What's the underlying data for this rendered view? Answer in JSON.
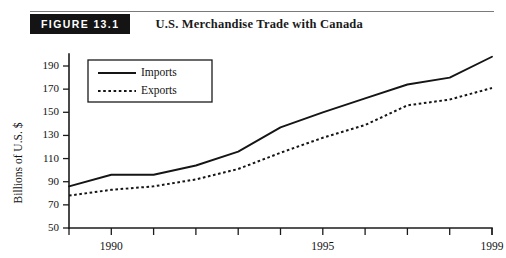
{
  "figure": {
    "badge_label": "FIGURE 13.1",
    "title": "U.S. Merchandise Trade with Canada"
  },
  "chart_data": {
    "type": "line",
    "title": "U.S. Merchandise Trade with Canada",
    "xlabel": "",
    "ylabel": "Billions of U.S. $",
    "x": [
      1989,
      1990,
      1991,
      1992,
      1993,
      1994,
      1995,
      1996,
      1997,
      1998,
      1999
    ],
    "xlim": [
      1989,
      1999
    ],
    "ylim": [
      50,
      190
    ],
    "yticks": [
      50,
      70,
      90,
      110,
      130,
      150,
      170,
      190
    ],
    "xticks": [
      1989,
      1990,
      1991,
      1992,
      1993,
      1994,
      1995,
      1996,
      1997,
      1998,
      1999
    ],
    "xtick_labels": [
      "",
      "1990",
      "",
      "",
      "",
      "",
      "1995",
      "",
      "",
      "",
      "1999"
    ],
    "grid": false,
    "legend_position": "upper left",
    "series": [
      {
        "name": "Imports",
        "style": "solid",
        "values": [
          86,
          96,
          96,
          104,
          116,
          137,
          150,
          162,
          174,
          180,
          198
        ]
      },
      {
        "name": "Exports",
        "style": "dotted",
        "values": [
          78,
          83,
          86,
          92,
          101,
          115,
          128,
          139,
          156,
          161,
          171
        ]
      }
    ]
  }
}
